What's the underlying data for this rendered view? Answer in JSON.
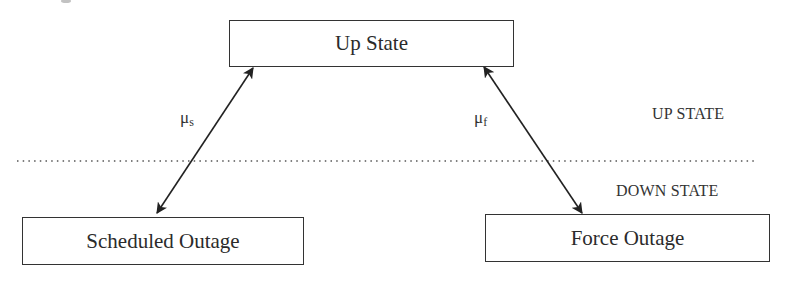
{
  "diagram": {
    "type": "state-transition",
    "states": [
      {
        "id": "up",
        "label": "Up State"
      },
      {
        "id": "scheduled",
        "label": "Scheduled Outage"
      },
      {
        "id": "forced",
        "label": "Force Outage"
      }
    ],
    "transitions": [
      {
        "from": "up",
        "to": "scheduled",
        "bidirectional": true,
        "rate_symbol": "μ",
        "rate_subscript": "s"
      },
      {
        "from": "up",
        "to": "forced",
        "bidirectional": true,
        "rate_symbol": "μ",
        "rate_subscript": "f"
      }
    ],
    "regions": {
      "upper": "UP STATE",
      "lower": "DOWN STATE"
    },
    "divider_style": "dotted",
    "colors": {
      "line": "#333333",
      "text": "#2b2b2b",
      "background": "#ffffff"
    }
  }
}
